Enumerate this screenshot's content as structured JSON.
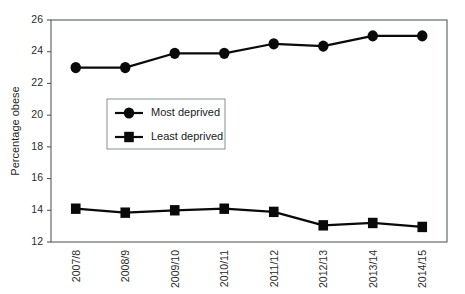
{
  "chart_data": {
    "type": "line",
    "title": "",
    "subtitle": "",
    "xlabel": "",
    "ylabel": "Percentage obese",
    "categories": [
      "2007/8",
      "2008/9",
      "2009/10",
      "2010/11",
      "2011/12",
      "2012/13",
      "2013/14",
      "2014/15"
    ],
    "series": [
      {
        "name": "Most deprived",
        "marker": "circle",
        "color": "#0a0a0a",
        "values": [
          23.0,
          23.0,
          23.9,
          23.9,
          24.5,
          24.35,
          25.0,
          25.0
        ]
      },
      {
        "name": "Least deprived",
        "marker": "square",
        "color": "#0a0a0a",
        "values": [
          14.1,
          13.85,
          14.0,
          14.1,
          13.9,
          13.05,
          13.2,
          12.95
        ]
      }
    ],
    "ylim": [
      12,
      26
    ],
    "yticks": [
      12,
      14,
      16,
      18,
      20,
      22,
      24,
      26
    ],
    "ytick_labels": [
      "12",
      "14",
      "16",
      "18",
      "20",
      "22",
      "24",
      "26"
    ],
    "grid": false,
    "legend_position": "inside-left-upper-middle",
    "xtick_rotation": -90
  },
  "axes": {
    "y_title": "Percentage obese"
  },
  "legend": {
    "entries": [
      {
        "label": "Most deprived",
        "marker": "circle-marker-icon"
      },
      {
        "label": "Least deprived",
        "marker": "square-marker-icon"
      }
    ]
  }
}
